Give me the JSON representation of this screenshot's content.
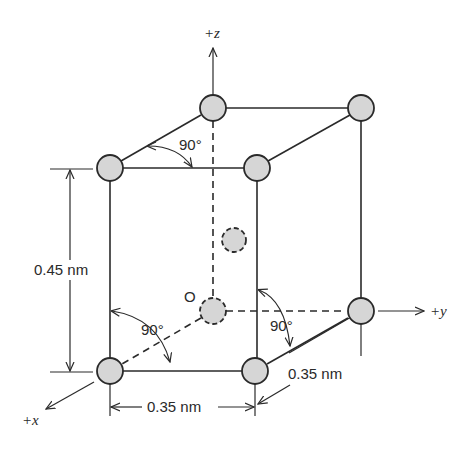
{
  "figure": {
    "type": "crystal unit cell (body-centered tetragonal)",
    "axes": {
      "x": "+x",
      "y": "+y",
      "z": "+z",
      "origin": "O"
    },
    "dimensions": {
      "height": "0.45 nm",
      "width_x": "0.35 nm",
      "width_y": "0.35 nm"
    },
    "angles": {
      "top": "90°",
      "left": "90°",
      "right": "90°"
    },
    "colors": {
      "atom_fill": "#d6d6d6",
      "line": "#2a2a2a",
      "background": "#ffffff"
    }
  }
}
